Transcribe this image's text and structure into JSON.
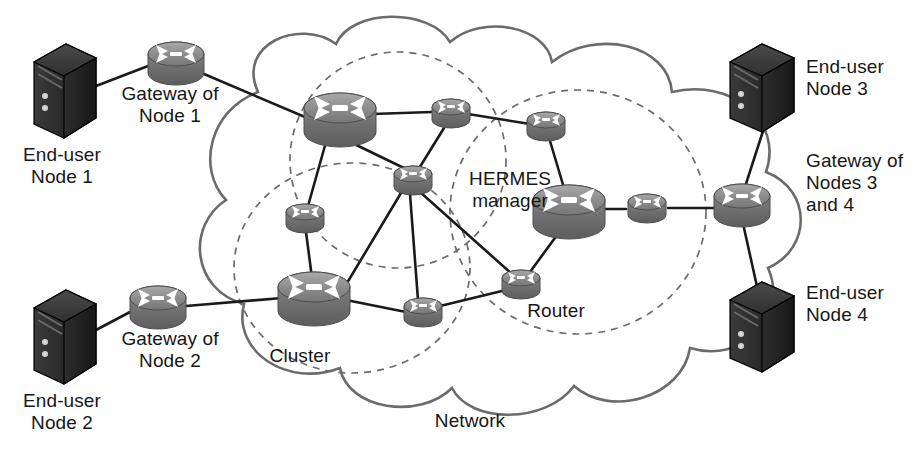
{
  "diagram": {
    "type": "network-topology",
    "background": "#ffffff",
    "palette": {
      "server_dark": "#262626",
      "server_edge": "#000000",
      "router_gray_light": "#b9b9b9",
      "router_gray_mid": "#8e8e8e",
      "router_gray_dark": "#6e6e6e",
      "link_line": "#1a1a1a",
      "cloud_outline": "#6b6b6b",
      "cluster_dashed": "#6b6b6b",
      "text": "#161616"
    },
    "labels": [
      {
        "id": "end-user-node-1",
        "text": "End-user\nNode 1",
        "x": 62,
        "y": 156,
        "align": "center"
      },
      {
        "id": "gateway-of-node-1",
        "text": "Gateway of\nNode 1",
        "x": 168,
        "y": 92,
        "align": "center"
      },
      {
        "id": "end-user-node-2",
        "text": "End-user\nNode 2",
        "x": 62,
        "y": 400,
        "align": "center"
      },
      {
        "id": "gateway-of-node-2",
        "text": "Gateway of\nNode 2",
        "x": 168,
        "y": 338,
        "align": "center"
      },
      {
        "id": "end-user-node-3",
        "text": "End-user\nNode 3",
        "x": 851,
        "y": 60,
        "align": "center"
      },
      {
        "id": "gateway-nodes-3-4",
        "text": "Gateway of\nNodes 3\nand 4",
        "x": 851,
        "y": 160,
        "align": "center"
      },
      {
        "id": "end-user-node-4",
        "text": "End-user\nNode 4",
        "x": 851,
        "y": 288,
        "align": "center"
      },
      {
        "id": "hermes-manager",
        "text": "HERMES\nmanager",
        "x": 508,
        "y": 175,
        "align": "center"
      },
      {
        "id": "router",
        "text": "Router",
        "x": 553,
        "y": 310,
        "align": "center"
      },
      {
        "id": "cluster",
        "text": "Cluster",
        "x": 300,
        "y": 352,
        "align": "center"
      },
      {
        "id": "network",
        "text": "Network",
        "x": 470,
        "y": 418,
        "align": "center"
      }
    ],
    "servers": [
      {
        "id": "server-node-1",
        "label_ref": "end-user-node-1",
        "x": 62,
        "y": 85
      },
      {
        "id": "server-node-2",
        "label_ref": "end-user-node-2",
        "x": 62,
        "y": 330
      },
      {
        "id": "server-node-3",
        "label_ref": "end-user-node-3",
        "x": 762,
        "y": 88
      },
      {
        "id": "server-node-4",
        "label_ref": "end-user-node-4",
        "x": 762,
        "y": 330
      }
    ],
    "routers": [
      {
        "id": "gw-node-1",
        "role": "gateway",
        "x": 176,
        "y": 66,
        "size": "medium"
      },
      {
        "id": "gw-node-2",
        "role": "gateway",
        "x": 158,
        "y": 310,
        "size": "medium"
      },
      {
        "id": "gw-nodes-3-4",
        "role": "gateway",
        "x": 742,
        "y": 208,
        "size": "medium"
      },
      {
        "id": "cluster-head-top",
        "role": "cluster-head",
        "x": 340,
        "y": 117,
        "size": "large"
      },
      {
        "id": "router-top-mid",
        "role": "router",
        "x": 451,
        "y": 114,
        "size": "small"
      },
      {
        "id": "router-upper-r",
        "role": "router",
        "x": 546,
        "y": 127,
        "size": "small"
      },
      {
        "id": "router-mid-a",
        "role": "router",
        "x": 413,
        "y": 181,
        "size": "small"
      },
      {
        "id": "router-left-up",
        "role": "router",
        "x": 305,
        "y": 219,
        "size": "small"
      },
      {
        "id": "cluster-head-bl",
        "role": "cluster-head",
        "x": 314,
        "y": 296,
        "size": "large"
      },
      {
        "id": "router-bottom-m",
        "role": "router",
        "x": 423,
        "y": 313,
        "size": "small"
      },
      {
        "id": "router-labeled",
        "role": "router",
        "x": 521,
        "y": 285,
        "size": "small"
      },
      {
        "id": "hermes-mgr",
        "role": "cluster-head",
        "x": 569,
        "y": 209,
        "size": "large"
      },
      {
        "id": "router-right-e",
        "role": "router",
        "x": 647,
        "y": 209,
        "size": "small"
      }
    ],
    "links": [
      {
        "from": "server-node-1",
        "to": "gw-node-1"
      },
      {
        "from": "gw-node-1",
        "to": "cluster-head-top"
      },
      {
        "from": "server-node-2",
        "to": "gw-node-2"
      },
      {
        "from": "gw-node-2",
        "to": "cluster-head-bl"
      },
      {
        "from": "server-node-3",
        "to": "gw-nodes-3-4"
      },
      {
        "from": "server-node-4",
        "to": "gw-nodes-3-4"
      },
      {
        "from": "gw-nodes-3-4",
        "to": "router-right-e"
      },
      {
        "from": "router-right-e",
        "to": "hermes-mgr"
      },
      {
        "from": "cluster-head-top",
        "to": "router-top-mid"
      },
      {
        "from": "cluster-head-top",
        "to": "router-mid-a"
      },
      {
        "from": "cluster-head-top",
        "to": "router-left-up"
      },
      {
        "from": "router-top-mid",
        "to": "router-mid-a"
      },
      {
        "from": "router-top-mid",
        "to": "router-upper-r"
      },
      {
        "from": "router-upper-r",
        "to": "hermes-mgr"
      },
      {
        "from": "router-mid-a",
        "to": "router-bottom-m"
      },
      {
        "from": "router-mid-a",
        "to": "router-labeled"
      },
      {
        "from": "router-left-up",
        "to": "cluster-head-bl"
      },
      {
        "from": "cluster-head-bl",
        "to": "router-bottom-m"
      },
      {
        "from": "cluster-head-bl",
        "to": "router-mid-a"
      },
      {
        "from": "router-bottom-m",
        "to": "router-labeled"
      },
      {
        "from": "router-labeled",
        "to": "hermes-mgr"
      }
    ],
    "clusters": [
      {
        "id": "cluster-top",
        "cx": 398,
        "cy": 160,
        "rx": 108,
        "ry": 108
      },
      {
        "id": "cluster-left",
        "cx": 352,
        "cy": 268,
        "rx": 118,
        "ry": 105
      },
      {
        "id": "cluster-right",
        "cx": 578,
        "cy": 212,
        "rx": 128,
        "ry": 122
      }
    ]
  }
}
